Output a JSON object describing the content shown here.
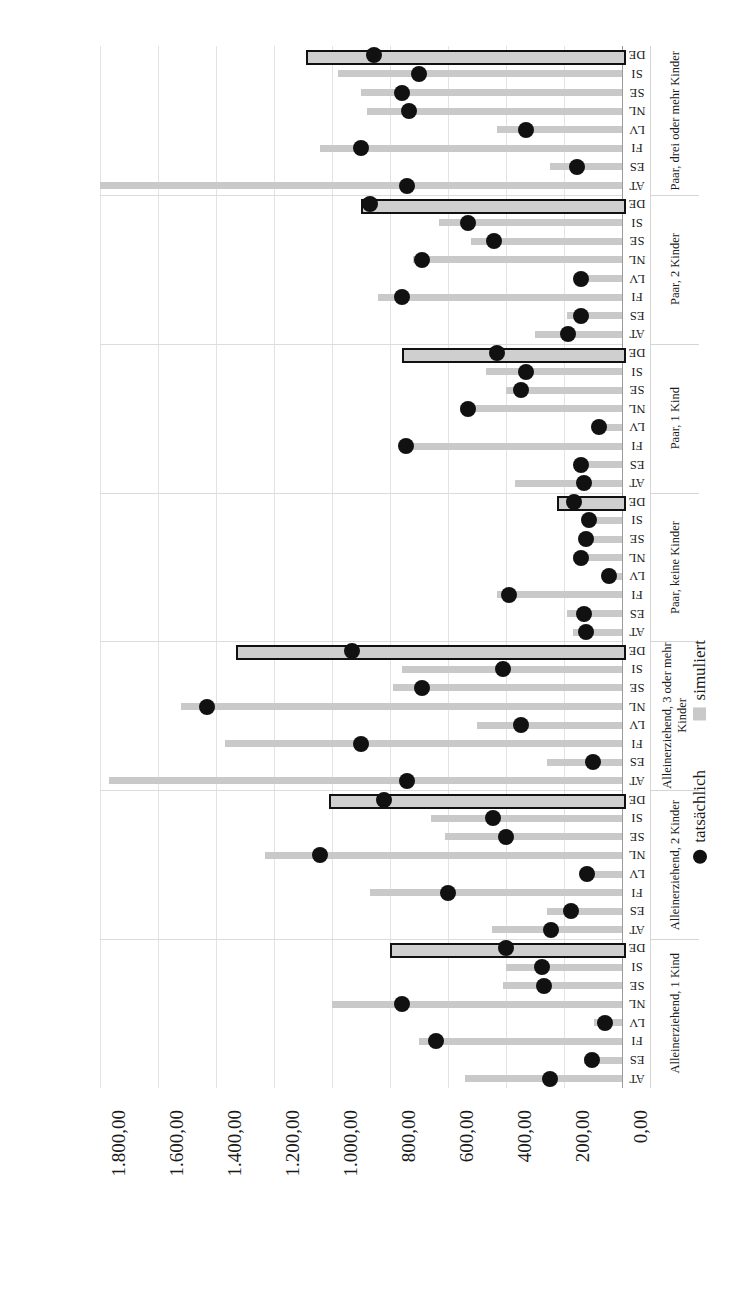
{
  "chart_data": {
    "type": "bar",
    "title": "",
    "xlabel": "",
    "ylabel": "",
    "orientation": "horizontal",
    "xlim": [
      0,
      1800
    ],
    "grid": true,
    "legend_position": "bottom-right-rotated",
    "tick_labels": [
      "1.800,00",
      "1.600,00",
      "1.400,00",
      "1.200,00",
      "1.000,00",
      "800,00",
      "600,00",
      "400,00",
      "200,00",
      "0,00"
    ],
    "tick_values": [
      1800,
      1600,
      1400,
      1200,
      1000,
      800,
      600,
      400,
      200,
      0
    ],
    "series": [
      {
        "name": "simuliert",
        "type": "bar",
        "color": "#c9c9c9"
      },
      {
        "name": "tatsächlich",
        "type": "scatter",
        "color": "#111111"
      }
    ],
    "groups": [
      {
        "label": "Paar, drei oder mehr Kinder",
        "countries": [
          "DE",
          "SI",
          "SE",
          "NL",
          "LV",
          "FI",
          "ES",
          "AT"
        ],
        "simuliert": [
          1090,
          980,
          900,
          880,
          430,
          1040,
          250,
          1800
        ],
        "tatsaechlich": [
          855,
          700,
          760,
          735,
          330,
          900,
          155,
          740
        ]
      },
      {
        "label": "Paar, 2 Kinder",
        "countries": [
          "DE",
          "SI",
          "SE",
          "NL",
          "LV",
          "FI",
          "ES",
          "AT"
        ],
        "simuliert": [
          900,
          630,
          520,
          720,
          160,
          840,
          190,
          300
        ],
        "tatsaechlich": [
          870,
          530,
          440,
          690,
          140,
          760,
          140,
          185
        ]
      },
      {
        "label": "Paar, 1 Kind",
        "countries": [
          "DE",
          "SI",
          "SE",
          "NL",
          "LV",
          "FI",
          "ES",
          "AT"
        ],
        "simuliert": [
          760,
          470,
          400,
          560,
          100,
          740,
          160,
          370
        ],
        "tatsaechlich": [
          430,
          330,
          350,
          530,
          80,
          745,
          140,
          130
        ]
      },
      {
        "label": "Paar, keine Kinder",
        "countries": [
          "DE",
          "SI",
          "SE",
          "NL",
          "LV",
          "FI",
          "ES",
          "AT"
        ],
        "simuliert": [
          225,
          110,
          140,
          170,
          55,
          430,
          190,
          170
        ],
        "tatsaechlich": [
          165,
          115,
          125,
          140,
          45,
          390,
          130,
          125
        ]
      },
      {
        "label": "Alleinerziehend, 3 oder mehr Kinder",
        "countries": [
          "DE",
          "SI",
          "SE",
          "NL",
          "LV",
          "FI",
          "ES",
          "AT"
        ],
        "simuliert": [
          1330,
          760,
          790,
          1520,
          500,
          1370,
          260,
          1770
        ],
        "tatsaechlich": [
          930,
          410,
          690,
          1430,
          350,
          900,
          100,
          740
        ]
      },
      {
        "label": "Alleinerziehend, 2 Kinder",
        "countries": [
          "DE",
          "SI",
          "SE",
          "NL",
          "LV",
          "FI",
          "ES",
          "AT"
        ],
        "simuliert": [
          1010,
          660,
          610,
          1230,
          120,
          870,
          260,
          450
        ],
        "tatsaechlich": [
          820,
          445,
          400,
          1040,
          120,
          600,
          175,
          245
        ]
      },
      {
        "label": "Alleinerziehend, 1 Kind",
        "countries": [
          "DE",
          "SI",
          "SE",
          "NL",
          "LV",
          "FI",
          "ES",
          "AT"
        ],
        "simuliert": [
          800,
          400,
          410,
          1000,
          95,
          700,
          130,
          540
        ],
        "tatsaechlich": [
          400,
          275,
          270,
          760,
          60,
          640,
          105,
          250
        ]
      }
    ]
  },
  "legend": {
    "simuliert_label": "simuliert",
    "tatsaechlich_label": "tatsächlich"
  },
  "colors": {
    "bar": "#c9c9c9",
    "dot": "#111111",
    "grid": "#e3e3e3",
    "highlight_outline": "#111111"
  }
}
